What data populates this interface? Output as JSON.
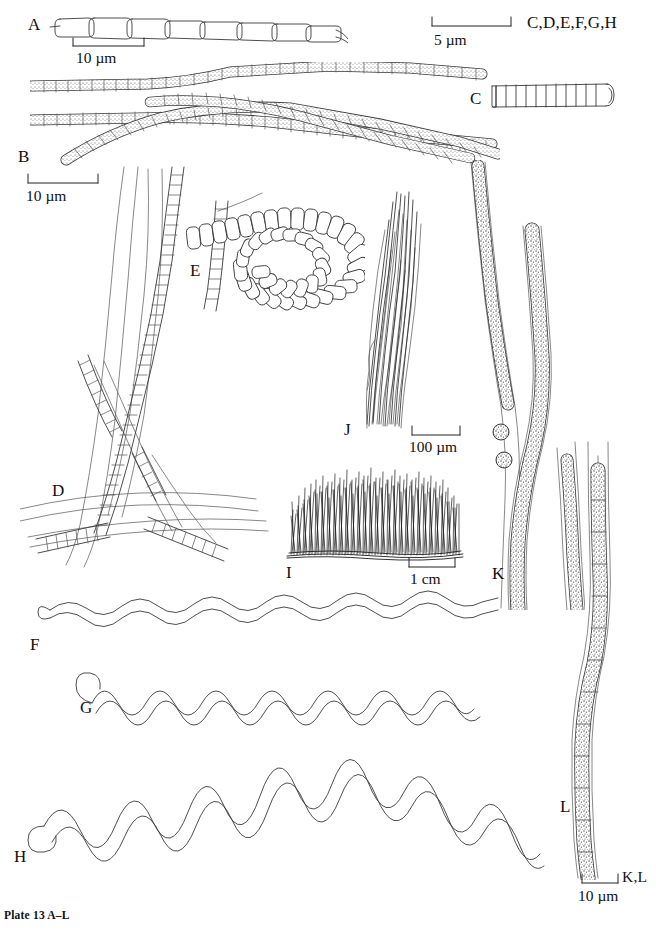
{
  "plate": {
    "caption": "Plate 13 A–L",
    "background_color": "#ffffff",
    "ink_color": "#3a3a3a",
    "width": 656,
    "height": 931
  },
  "figure_labels": {
    "a": "A",
    "b": "B",
    "c": "C",
    "d": "D",
    "e": "E",
    "f": "F",
    "g": "G",
    "h": "H",
    "i": "I",
    "j": "J",
    "k": "K",
    "l": "L"
  },
  "scale_bars": [
    {
      "id": "scale-a",
      "value": "10 µm",
      "applies_to": "A",
      "applies_to_text": ""
    },
    {
      "id": "scale-cdefgh",
      "value": "5 µm",
      "applies_to": "C,D,E,F,G,H",
      "applies_to_text": "C,D,E,F,G,H"
    },
    {
      "id": "scale-b",
      "value": "10 µm",
      "applies_to": "B",
      "applies_to_text": ""
    },
    {
      "id": "scale-j",
      "value": "100 µm",
      "applies_to": "J",
      "applies_to_text": ""
    },
    {
      "id": "scale-i",
      "value": "1 cm",
      "applies_to": "I",
      "applies_to_text": ""
    },
    {
      "id": "scale-kl",
      "value": "10 µm",
      "applies_to": "K,L",
      "applies_to_text": "K,L"
    }
  ],
  "specimens": [
    {
      "label": "A",
      "description": "uniseriate filament of elongate empty cells"
    },
    {
      "label": "B",
      "description": "crossing granulate trichomes"
    },
    {
      "label": "C",
      "description": "short barrel-celled trichome"
    },
    {
      "label": "D",
      "description": "tangled sheathed filaments"
    },
    {
      "label": "E",
      "description": "coiled trichome spiral"
    },
    {
      "label": "F",
      "description": "low-amplitude helical trichome"
    },
    {
      "label": "G",
      "description": "medium-amplitude helical trichome"
    },
    {
      "label": "H",
      "description": "high-amplitude arched helical trichome"
    },
    {
      "label": "I",
      "description": "turf habit, macroscopic"
    },
    {
      "label": "J",
      "description": "fascicle of filaments"
    },
    {
      "label": "K",
      "description": "sheathed trichomes with granular contents"
    },
    {
      "label": "L",
      "description": "single sheathed trichome in wide sheath"
    }
  ]
}
